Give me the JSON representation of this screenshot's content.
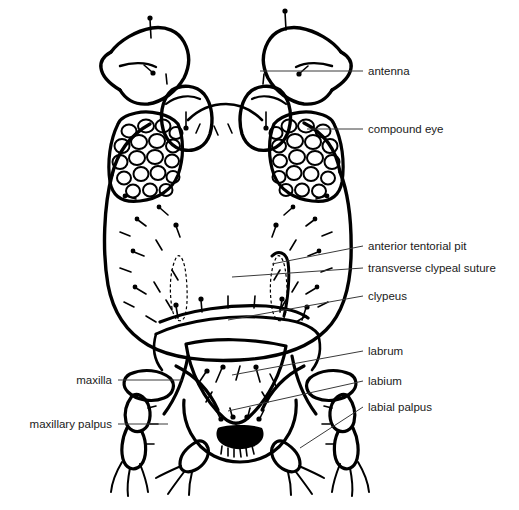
{
  "figure": {
    "background_color": "#ffffff",
    "ink_color": "#000000",
    "leader_color": "#3a3a3a",
    "label_color": "#1a1a1a",
    "width": 519,
    "height": 510
  },
  "labels": [
    {
      "id": "antenna",
      "text": "antenna",
      "text_x": 368,
      "text_y": 75,
      "anchor": "start",
      "leader": "M 260 71 L 363 71",
      "target_part": "antenna"
    },
    {
      "id": "compound-eye",
      "text": "compound eye",
      "text_x": 368,
      "text_y": 133,
      "anchor": "start",
      "leader": "M 307 129 L 363 129",
      "target_part": "compound-eye"
    },
    {
      "id": "anterior-tentorial-pit",
      "text": "anterior tentorial pit",
      "text_x": 368,
      "text_y": 250,
      "anchor": "start",
      "leader": "M 272 264 L 363 246",
      "target_part": "anterior-tentorial-pit"
    },
    {
      "id": "transverse-clypeal-suture",
      "text": "transverse clypeal suture",
      "text_x": 368,
      "text_y": 272,
      "anchor": "start",
      "leader": "M 232 277 L 363 268",
      "target_part": "transverse-clypeal-suture"
    },
    {
      "id": "clypeus",
      "text": "clypeus",
      "text_x": 368,
      "text_y": 300,
      "anchor": "start",
      "leader": "M 228 320 L 363 296",
      "target_part": "clypeus"
    },
    {
      "id": "labrum",
      "text": "labrum",
      "text_x": 368,
      "text_y": 355,
      "anchor": "start",
      "leader": "M 232 375 L 363 351",
      "target_part": "labrum"
    },
    {
      "id": "labium",
      "text": "labium",
      "text_x": 368,
      "text_y": 385,
      "anchor": "start",
      "leader": "M 228 411 L 363 381",
      "target_part": "labium"
    },
    {
      "id": "labial-palpus",
      "text": "labial palpus",
      "text_x": 368,
      "text_y": 411,
      "anchor": "start",
      "leader": "M 300 448 L 363 407",
      "target_part": "labial-palpus"
    },
    {
      "id": "maxilla",
      "text": "maxilla",
      "text_x": 112,
      "text_y": 384,
      "anchor": "end",
      "leader": "M 118 380 L 182 380",
      "target_part": "maxilla"
    },
    {
      "id": "maxillary-palpus",
      "text": "maxillary palpus",
      "text_x": 112,
      "text_y": 428,
      "anchor": "end",
      "leader": "M 118 424 L 168 424",
      "target_part": "maxillary-palpus"
    }
  ],
  "parts": {
    "head_capsule": "head-capsule",
    "left_eye": "compound-eye-left",
    "right_eye": "compound-eye-right",
    "left_antenna": "antenna-left",
    "right_antenna": "antenna-right",
    "clypeus": "clypeus-plate",
    "labrum": "labrum-plate",
    "labium": "labium-plate",
    "left_maxillary_palpus": "maxillary-palpus-left",
    "right_maxillary_palpus": "maxillary-palpus-right",
    "left_labial_palpus": "labial-palpus-left",
    "right_labial_palpus": "labial-palpus-right"
  }
}
